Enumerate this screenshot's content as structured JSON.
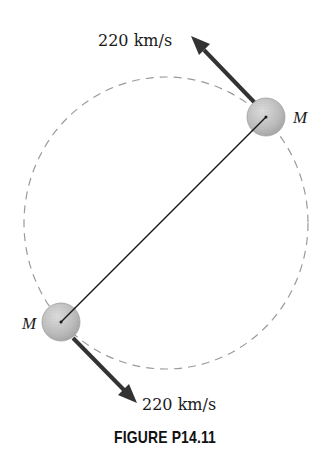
{
  "figure": {
    "caption": "FIGURE P14.11",
    "orbit": {
      "style": "dashed",
      "color": "#9a9a9a",
      "cx": 166,
      "cy": 223,
      "rx": 142,
      "ry": 146
    },
    "connector_line": {
      "color": "#1a1a1a"
    },
    "masses": [
      {
        "id": "top-right",
        "label": "M",
        "cx": 266,
        "cy": 117,
        "r": 18,
        "fill": "#c4c4c4"
      },
      {
        "id": "bottom-left",
        "label": "M",
        "cx": 61,
        "cy": 322,
        "r": 18,
        "fill": "#c4c4c4"
      }
    ],
    "velocities": [
      {
        "id": "top-arrow",
        "label": "220 km/s",
        "direction": "up-left",
        "color": "#333333"
      },
      {
        "id": "bottom-arrow",
        "label": "220 km/s",
        "direction": "down-right",
        "color": "#333333"
      }
    ]
  }
}
